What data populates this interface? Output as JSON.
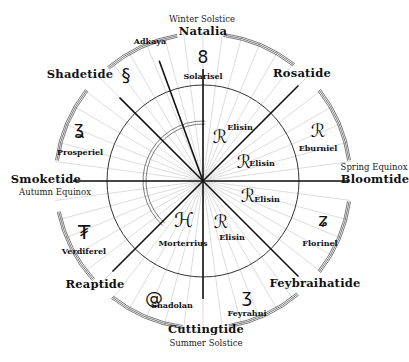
{
  "diagram": {
    "type": "seasonal-calendar-wheel",
    "center": [
      203,
      181
    ],
    "inner_radius": 96,
    "outer_radius": 149,
    "colors": {
      "ink": "#111111",
      "fine_line": "#bbbbbb",
      "background": "#ffffff"
    }
  },
  "events": {
    "winter": "Winter Solstice",
    "spring": "Spring Equinox",
    "summer": "Summer Solstice",
    "autumn": "Autumn Equinox"
  },
  "seasons": {
    "natalia": "Natalia",
    "rosatide": "Rosatide",
    "bloomtide": "Bloomtide",
    "feybraihatide": "Feybraihatide",
    "cuttingtide": "Cuttingtide",
    "reaptide": "Reaptide",
    "smoketide": "Smoketide",
    "shadetide": "Shadetide"
  },
  "deities": {
    "adkaya": "Adkaya",
    "solarisel": "Solarisel",
    "eburniel": "Eburniel",
    "florinel": "Florinel",
    "feyrahni": "Feyrahni",
    "shadolan": "Shadolan",
    "verdiferel": "Verdiferel",
    "prosperiel": "Prosperiel",
    "morterrius": "Morterrius",
    "elisin_1": "Elisin",
    "elisin_2": "Elisin",
    "elisin_3": "Elisin",
    "elisin_4": "Elisin"
  },
  "glyphs": {
    "adkaya": "§",
    "solarisel": "8",
    "eburniel": "ℛ",
    "florinel": "ʑ",
    "feyrahni": "ʒ",
    "shadolan": "@",
    "verdiferel": "₮",
    "prosperiel": "ʓ",
    "morterrius": "ℋ",
    "elisin": "ℛ"
  }
}
